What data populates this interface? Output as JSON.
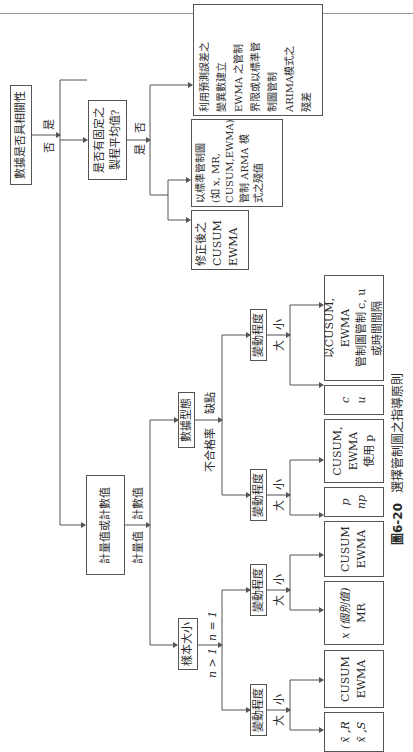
{
  "figure": {
    "number": "圖6-20",
    "title": "選擇管制圖之指導原則"
  },
  "nodes": {
    "root": "數據是否具相關性",
    "variable_or_attribute": "計量值或計數值",
    "fixed_mean": "是否有固定之製程平均值?",
    "data_type": "數據型態",
    "sample_size": "樣本大小",
    "variation_1": "變動程度",
    "variation_2": "變動程度",
    "variation_3": "變動程度",
    "variation_4": "變動程度"
  },
  "edge_labels": {
    "root_no": "否",
    "root_yes": "是",
    "variable": "計量值",
    "attribute": "計數值",
    "n_gt_1": "n > 1",
    "n_eq_1": "n = 1",
    "nonconforming": "不合格率",
    "defects": "缺點",
    "fixed_yes": "是",
    "fixed_no": "否",
    "large_1": "大",
    "small_1": "小",
    "large_2": "大",
    "small_2": "小",
    "large_3": "大",
    "small_3": "小",
    "large_4": "大",
    "small_4": "小"
  },
  "leaves": {
    "xbar_r_s": [
      "x̄ ,R",
      "x̄ ,S"
    ],
    "cusum_ewma_1": [
      "CUSUM",
      "EWMA"
    ],
    "individual_mr": [
      "x (個別值)",
      "MR"
    ],
    "cusum_ewma_2": [
      "CUSUM",
      "EWMA"
    ],
    "p_np": [
      "p",
      "np"
    ],
    "cusum_ewma_p": [
      "CUSUM,",
      "EWMA",
      "使用 p"
    ],
    "c_u": [
      "c",
      "u"
    ],
    "cusum_ewma_cu": [
      "以CUSUM, EWMA",
      "管制圖管制 c, u",
      "或時間間隔"
    ],
    "modified_cusum": [
      "修正後之",
      "CUSUM",
      "EWMA"
    ],
    "standard_residuals": [
      "以標準管制圖",
      "(如 x, MR,",
      "CUSUM,EWMA)",
      "管制 ARMA 模",
      "式之殘值"
    ],
    "forecast_error": [
      "利用預測誤差之",
      "變異數建立",
      "EWMA 之管制",
      "界限或以標準管",
      "制圖管制",
      "ARIMA模式之",
      "殘差"
    ]
  }
}
